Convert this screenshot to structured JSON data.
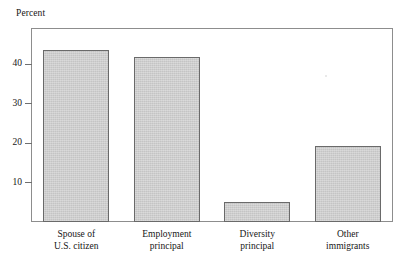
{
  "chart_data": {
    "type": "bar",
    "title": "Percent",
    "xlabel": "",
    "ylabel": "Percent",
    "categories": [
      "Spouse of U.S. citizen",
      "Employment principal",
      "Diversity principal",
      "Other immigrants"
    ],
    "category_lines": [
      [
        "Spouse of",
        "U.S. citizen"
      ],
      [
        "Employment",
        "principal"
      ],
      [
        "Diversity",
        "principal"
      ],
      [
        "Other",
        "immigrants"
      ]
    ],
    "values": [
      43.5,
      41.8,
      5.1,
      19.1
    ],
    "ylim": [
      0,
      49
    ],
    "yticks": [
      10,
      20,
      30,
      40
    ],
    "ytick_labels": [
      "10",
      "20",
      "30",
      "40"
    ],
    "grid": false,
    "legend": null,
    "bar_fill_color": "#c9c9c9",
    "bar_border_color": "#6a6a6a",
    "frame_color": "#8d8d8d",
    "text_color": "#161616"
  }
}
